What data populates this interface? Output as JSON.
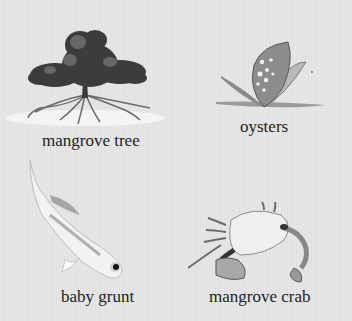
{
  "organisms": [
    {
      "id": "mangrove-tree",
      "label": "mangrove tree"
    },
    {
      "id": "oysters",
      "label": "oysters"
    },
    {
      "id": "baby-grunt",
      "label": "baby grunt"
    },
    {
      "id": "mangrove-crab",
      "label": "mangrove crab"
    }
  ],
  "colors": {
    "background": "#e4e4e4",
    "text": "#1e1e1e"
  }
}
